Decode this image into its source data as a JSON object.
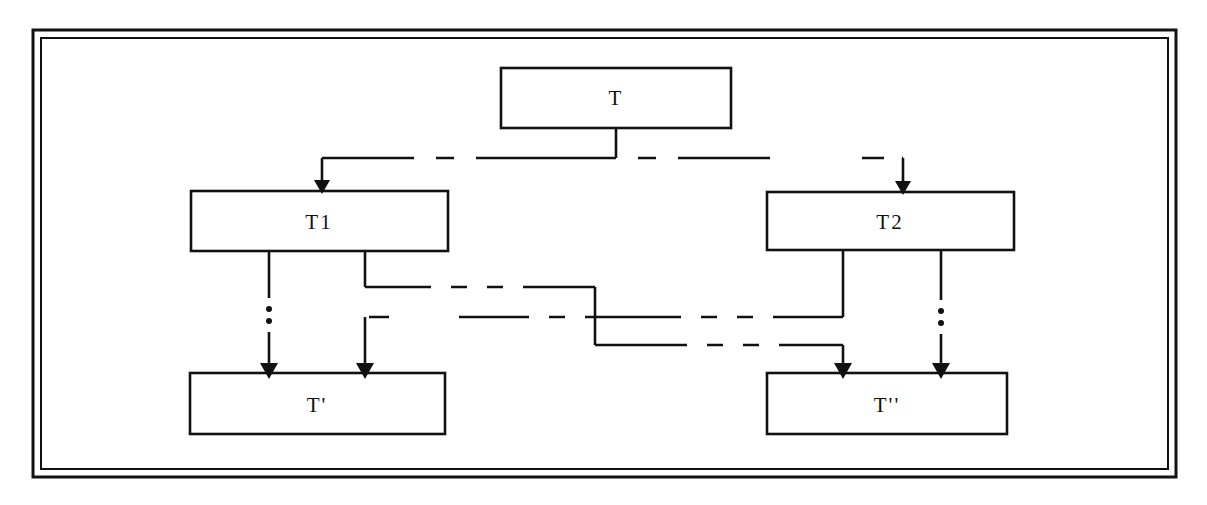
{
  "figure": {
    "background": "#ffffff",
    "stroke_color": "#111111",
    "frame": {
      "outer": {
        "x": 33,
        "y": 30,
        "width": 1143,
        "height": 447
      },
      "inner": {
        "x": 41,
        "y": 38,
        "width": 1127,
        "height": 431
      },
      "style": "double-rule"
    },
    "nodes": [
      {
        "id": "T",
        "label": "T",
        "x": 501,
        "y": 68,
        "width": 230,
        "height": 60
      },
      {
        "id": "T1",
        "label": "T1",
        "x": 191,
        "y": 191,
        "width": 257,
        "height": 60
      },
      {
        "id": "T2",
        "label": "T2",
        "x": 767,
        "y": 192,
        "width": 247,
        "height": 58
      },
      {
        "id": "Tp",
        "label": "T'",
        "x": 190,
        "y": 373,
        "width": 255,
        "height": 61
      },
      {
        "id": "Tpp",
        "label": "T''",
        "x": 767,
        "y": 373,
        "width": 240,
        "height": 61
      }
    ],
    "edges": [
      {
        "id": "T-to-T1",
        "from": "T",
        "to": "T1",
        "style": "dashed-elbow",
        "arrow": "filled-triangle-down"
      },
      {
        "id": "T-to-T2",
        "from": "T",
        "to": "T2",
        "style": "dashed-elbow",
        "arrow": "filled-triangle-down"
      },
      {
        "id": "T1-to-Tp",
        "from": "T1",
        "to": "Tp",
        "style": "vertical-ellipsis",
        "arrow": "filled-triangle-down"
      },
      {
        "id": "T1-to-Tpp",
        "from": "T1",
        "to": "Tpp",
        "style": "dashed-elbow",
        "arrow": "filled-triangle-down"
      },
      {
        "id": "T2-to-Tp",
        "from": "T2",
        "to": "Tp",
        "style": "dashed-elbow",
        "arrow": "filled-triangle-down"
      },
      {
        "id": "T2-to-Tpp",
        "from": "T2",
        "to": "Tpp",
        "style": "vertical-ellipsis",
        "arrow": "filled-triangle-down"
      }
    ],
    "ellipsis_marks": [
      {
        "id": "ellipsis-left",
        "x": 269,
        "y": 312
      },
      {
        "id": "ellipsis-right",
        "x": 941,
        "y": 314
      }
    ]
  }
}
